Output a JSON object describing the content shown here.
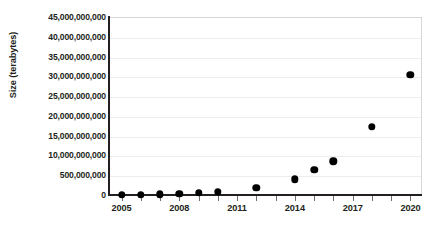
{
  "chart_data": {
    "type": "scatter",
    "title": "",
    "xlabel": "",
    "ylabel": "Size (terabytes)",
    "grid": true,
    "legend": null,
    "xlim": [
      2004.4,
      2020.6
    ],
    "ylim": [
      0,
      45000000000
    ],
    "x_tick_labels": [
      "2005",
      "2008",
      "2011",
      "2014",
      "2017",
      "2020"
    ],
    "x_tick_values": [
      2005,
      2008,
      2011,
      2014,
      2017,
      2020
    ],
    "x_minor_ticks": [
      2005,
      2006,
      2007,
      2008,
      2009,
      2010,
      2011,
      2012,
      2013,
      2014,
      2015,
      2016,
      2017,
      2018,
      2019,
      2020
    ],
    "y_tick_labels": [
      "45,000,000,000",
      "40,000,000,000",
      "35,000,000,000",
      "30,000,000,000",
      "25,000,000,000",
      "20,000,000,000",
      "15,000,000,000",
      "10,000,000,000",
      "500,000,000",
      "0"
    ],
    "y_tick_values": [
      45000000000,
      40000000000,
      35000000000,
      30000000000,
      25000000000,
      20000000000,
      15000000000,
      10000000000,
      5000000000,
      0
    ],
    "x": [
      2005,
      2006,
      2007,
      2008,
      2009,
      2010,
      2012,
      2014,
      2015,
      2016,
      2018,
      2020
    ],
    "values": [
      50000000,
      90000000,
      150000000,
      250000000,
      500000000,
      800000000,
      1800000000,
      4000000000,
      6300000000,
      8500000000,
      17200000000,
      30400000000
    ],
    "point_color": "#000000",
    "grid_color": "#ededed",
    "axis_color": "#231f20"
  }
}
